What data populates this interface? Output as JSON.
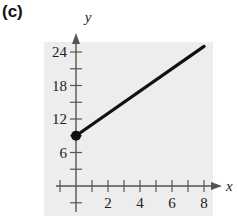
{
  "panel_label": "(c)",
  "colors": {
    "panel_bg": "#ededed",
    "axis": "#555555",
    "line": "#111111"
  },
  "chart_data": {
    "type": "line",
    "title": "",
    "xlabel": "x",
    "ylabel": "y",
    "x_ticks": [
      2,
      4,
      6,
      8
    ],
    "y_ticks": [
      6,
      12,
      18,
      24
    ],
    "xlim": [
      -1,
      8.5
    ],
    "ylim": [
      -3,
      26
    ],
    "grid": false,
    "series": [
      {
        "name": "line",
        "x": [
          0,
          8
        ],
        "y": [
          9,
          25
        ],
        "start_point_closed": true
      }
    ]
  }
}
